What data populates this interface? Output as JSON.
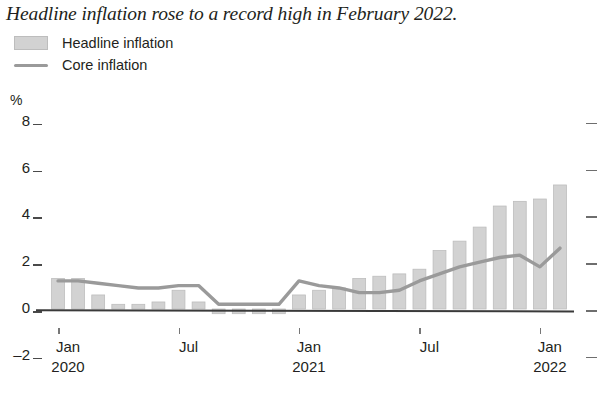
{
  "title": "Headline inflation rose to a record high in February 2022.",
  "legend": {
    "items": [
      {
        "label": "Headline inflation",
        "type": "bar",
        "color": "#d2d2d2",
        "icon": "filled-square-swatch"
      },
      {
        "label": "Core inflation",
        "type": "line",
        "color": "#9a9a9a",
        "icon": "line-swatch"
      }
    ]
  },
  "axis": {
    "y_unit": "%",
    "y_ticks": [
      "8",
      "6",
      "4",
      "2",
      "0",
      "-2"
    ],
    "x_ticks": [
      {
        "month": "Jan",
        "year": "2020"
      },
      {
        "month": "Jul",
        "year": ""
      },
      {
        "month": "Jan",
        "year": "2021"
      },
      {
        "month": "Jul",
        "year": ""
      },
      {
        "month": "Jan",
        "year": "2022"
      }
    ]
  },
  "chart_data": {
    "type": "bar",
    "title": "Headline inflation rose to a record high in February 2022.",
    "xlabel": "",
    "ylabel": "%",
    "ylim": [
      -2,
      8
    ],
    "yticks": [
      -2,
      0,
      2,
      4,
      6,
      8
    ],
    "grid": false,
    "legend_position": "top-left",
    "categories": [
      "Jan 2020",
      "Feb 2020",
      "Mar 2020",
      "Apr 2020",
      "May 2020",
      "Jun 2020",
      "Jul 2020",
      "Aug 2020",
      "Sep 2020",
      "Oct 2020",
      "Nov 2020",
      "Dec 2020",
      "Jan 2021",
      "Feb 2021",
      "Mar 2021",
      "Apr 2021",
      "May 2021",
      "Jun 2021",
      "Jul 2021",
      "Aug 2021",
      "Sep 2021",
      "Oct 2021",
      "Nov 2021",
      "Dec 2021",
      "Jan 2022",
      "Feb 2022"
    ],
    "series": [
      {
        "name": "Headline inflation",
        "type": "bar",
        "color": "#d2d2d2",
        "values": [
          1.3,
          1.3,
          0.6,
          0.2,
          0.2,
          0.3,
          0.8,
          0.3,
          -0.2,
          -0.2,
          -0.2,
          -0.2,
          0.6,
          0.8,
          0.9,
          1.3,
          1.4,
          1.5,
          1.7,
          2.5,
          2.9,
          3.5,
          4.4,
          4.6,
          4.7,
          5.3
        ]
      },
      {
        "name": "Core inflation",
        "type": "line",
        "color": "#9a9a9a",
        "values": [
          1.2,
          1.2,
          1.1,
          1.0,
          0.9,
          0.9,
          1.0,
          1.0,
          0.2,
          0.2,
          0.2,
          0.2,
          1.2,
          1.0,
          0.9,
          0.7,
          0.7,
          0.8,
          1.2,
          1.5,
          1.8,
          2.0,
          2.2,
          2.3,
          1.8,
          2.6
        ]
      }
    ]
  }
}
